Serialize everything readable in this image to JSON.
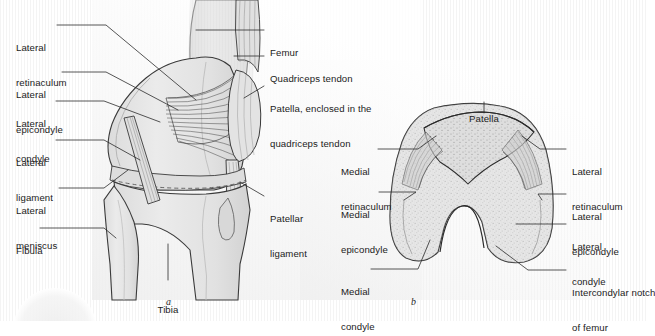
{
  "figure": {
    "background_color": "#ffffff",
    "line_color": "#2b2b2b",
    "bone_fill": "#e6e6e6",
    "bone_shadow": "#cfcfcf",
    "text_color": "#1b1b1b"
  },
  "panels": [
    {
      "id": "a",
      "caption": "a",
      "view": "lateral view of right knee"
    },
    {
      "id": "b",
      "caption": "b",
      "view": "posterior view of distal femur"
    }
  ],
  "labels_panel_a_left": [
    {
      "name": "lateral-retinaculum",
      "line1": "Lateral",
      "line2": "retinaculum"
    },
    {
      "name": "lateral-epicondyle",
      "line1": "Lateral",
      "line2": "epicondyle"
    },
    {
      "name": "lateral-condyle",
      "line1": "Lateral",
      "line2": "condyle"
    },
    {
      "name": "lateral-ligament",
      "line1": "Lateral",
      "line2": "ligament"
    },
    {
      "name": "lateral-meniscus",
      "line1": "Lateral",
      "line2": "meniscus"
    },
    {
      "name": "fibula",
      "line1": "Fibula",
      "line2": ""
    }
  ],
  "labels_panel_a_right": [
    {
      "name": "femur",
      "line1": "Femur",
      "line2": ""
    },
    {
      "name": "quadriceps-tendon",
      "line1": "Quadriceps tendon",
      "line2": ""
    },
    {
      "name": "patella-enclosed",
      "line1": "Patella, enclosed in the",
      "line2": "quadriceps tendon"
    },
    {
      "name": "patellar-ligament",
      "line1": "Patellar",
      "line2": "ligament"
    }
  ],
  "labels_panel_a_bottom": [
    {
      "name": "tibia",
      "line1": "Tibia",
      "line2": ""
    }
  ],
  "labels_panel_b_top": [
    {
      "name": "patella",
      "line1": "Patella",
      "line2": ""
    }
  ],
  "labels_panel_b_left": [
    {
      "name": "medial-retinaculum",
      "line1": "Medial",
      "line2": "retinaculum"
    },
    {
      "name": "medial-epicondyle",
      "line1": "Medial",
      "line2": "epicondyle"
    },
    {
      "name": "medial-condyle",
      "line1": "Medial",
      "line2": "condyle"
    }
  ],
  "labels_panel_b_right": [
    {
      "name": "lateral-retinaculum-b",
      "line1": "Lateral",
      "line2": "retinaculum"
    },
    {
      "name": "lateral-epicondyle-b",
      "line1": "Lateral",
      "line2": "epicondyle"
    },
    {
      "name": "lateral-condyle-b",
      "line1": "Lateral",
      "line2": "condyle"
    },
    {
      "name": "intercondylar-notch",
      "line1": "Intercondylar notch",
      "line2": "of femur"
    }
  ]
}
